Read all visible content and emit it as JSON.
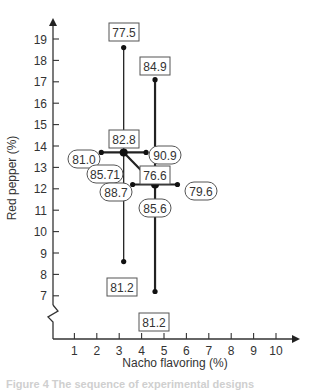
{
  "chart_data": {
    "type": "scatter",
    "title": "",
    "xlabel": "Nacho flavoring (%)",
    "ylabel": "Red pepper (%)",
    "xlim": [
      0,
      10.8
    ],
    "ylim": [
      6.3,
      19.7
    ],
    "x_ticks": [
      1,
      2,
      3,
      4,
      5,
      6,
      7,
      8,
      9,
      10
    ],
    "y_ticks": [
      7,
      8,
      9,
      10,
      11,
      12,
      13,
      14,
      15,
      16,
      17,
      18,
      19
    ],
    "y_axis_break": true,
    "grid": false,
    "legend": null,
    "design_centers": [
      {
        "x": 3.2,
        "y": 13.7,
        "label": "82.8",
        "label_style": "box"
      },
      {
        "x": 4.6,
        "y": 12.2,
        "label": "76.6",
        "label_style": "box"
      }
    ],
    "points": [
      {
        "x": 3.2,
        "y": 18.6,
        "label": "77.5",
        "label_style": "box",
        "series": "first design vertical"
      },
      {
        "x": 3.2,
        "y": 8.6,
        "label": "81.2",
        "label_style": "box",
        "series": "first design vertical"
      },
      {
        "x": 2.2,
        "y": 13.7,
        "label": "81.0",
        "label_style": "oval",
        "series": "first design horizontal"
      },
      {
        "x": 4.2,
        "y": 13.7,
        "label": "90.9",
        "label_style": "oval",
        "series": "first design horizontal"
      },
      {
        "x": 3.2,
        "y": 13.7,
        "label": "85.71",
        "label_style": "oval",
        "series": "first design center"
      },
      {
        "x": 4.6,
        "y": 17.1,
        "label": "84.9",
        "label_style": "box",
        "series": "second design vertical"
      },
      {
        "x": 4.6,
        "y": 7.2,
        "label": "81.2",
        "label_style": "box",
        "series": "second design vertical"
      },
      {
        "x": 3.6,
        "y": 12.2,
        "label": "88.7",
        "label_style": "oval",
        "series": "second design horizontal"
      },
      {
        "x": 5.6,
        "y": 12.2,
        "label": "79.6",
        "label_style": "oval",
        "series": "second design horizontal"
      },
      {
        "x": 4.6,
        "y": 12.2,
        "label": "85.6",
        "label_style": "oval",
        "series": "second design center"
      }
    ],
    "segments": [
      {
        "from": [
          3.2,
          8.6
        ],
        "to": [
          3.2,
          18.6
        ],
        "weight": "thin"
      },
      {
        "from": [
          2.2,
          13.7
        ],
        "to": [
          4.2,
          13.7
        ],
        "weight": "thick"
      },
      {
        "from": [
          4.6,
          7.2
        ],
        "to": [
          4.6,
          17.1
        ],
        "weight": "thick"
      },
      {
        "from": [
          3.6,
          12.2
        ],
        "to": [
          5.6,
          12.2
        ],
        "weight": "thick"
      },
      {
        "from": [
          3.2,
          13.7
        ],
        "to": [
          4.6,
          12.2
        ],
        "weight": "thick",
        "arrow": true
      }
    ]
  },
  "caption": "Figure 4  The sequence of experimental designs"
}
